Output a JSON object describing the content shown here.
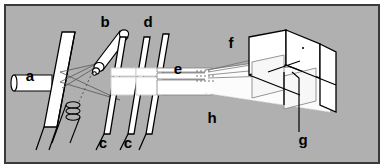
{
  "figure": {
    "background_color": "#b0b0b0",
    "border_color": "#3a3a3a",
    "stroke_color": "#000000",
    "fill_white": "#ffffff",
    "fill_light": "#f2f2f2",
    "ray_color": "#555555",
    "labels": [
      {
        "id": "a",
        "text": "a",
        "x": 30,
        "y": 81,
        "desc": "input-cylinder-source"
      },
      {
        "id": "b",
        "text": "b",
        "x": 105,
        "y": 27,
        "desc": "tilted-probe-cylinder"
      },
      {
        "id": "c1",
        "text": "c",
        "x": 103,
        "y": 148,
        "desc": "first-aperture-plate"
      },
      {
        "id": "c2",
        "text": "c",
        "x": 128,
        "y": 148,
        "desc": "second-aperture-plate"
      },
      {
        "id": "d",
        "text": "d",
        "x": 148,
        "y": 27,
        "desc": "third-plate"
      },
      {
        "id": "e",
        "text": "e",
        "x": 178,
        "y": 74,
        "desc": "collimated-beam-bar"
      },
      {
        "id": "f",
        "text": "f",
        "x": 231,
        "y": 48,
        "desc": "prism-entry-face"
      },
      {
        "id": "g",
        "text": "g",
        "x": 303,
        "y": 145,
        "desc": "detector-leader"
      },
      {
        "id": "h",
        "text": "h",
        "x": 212,
        "y": 123,
        "desc": "diverging-beam-cone"
      }
    ]
  }
}
